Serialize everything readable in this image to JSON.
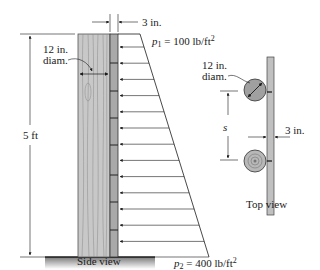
{
  "side_view": {
    "caption": "Side view",
    "height_label": "5 ft",
    "diameter_label_line1": "12 in.",
    "diameter_label_line2": "diam.",
    "board_thickness_label": "3 in.",
    "p1_symbol": "p",
    "p1_subscript": "1",
    "p1_value": " = 100 lb/ft",
    "p1_exp": "2",
    "p2_symbol": "p",
    "p2_subscript": "2",
    "p2_value": " = 400 lb/ft",
    "p2_exp": "2",
    "arrow_count": 13
  },
  "top_view": {
    "caption": "Top view",
    "diameter_label_line1": "12 in.",
    "diameter_label_line2": "diam.",
    "spacing_label": "s",
    "board_thickness_label": "3 in."
  },
  "colors": {
    "post_fill": "#c8c8c8",
    "board_fill": "#a9a9a9",
    "ground_fill": "#9a9a9a",
    "line": "#1a1a1a"
  }
}
